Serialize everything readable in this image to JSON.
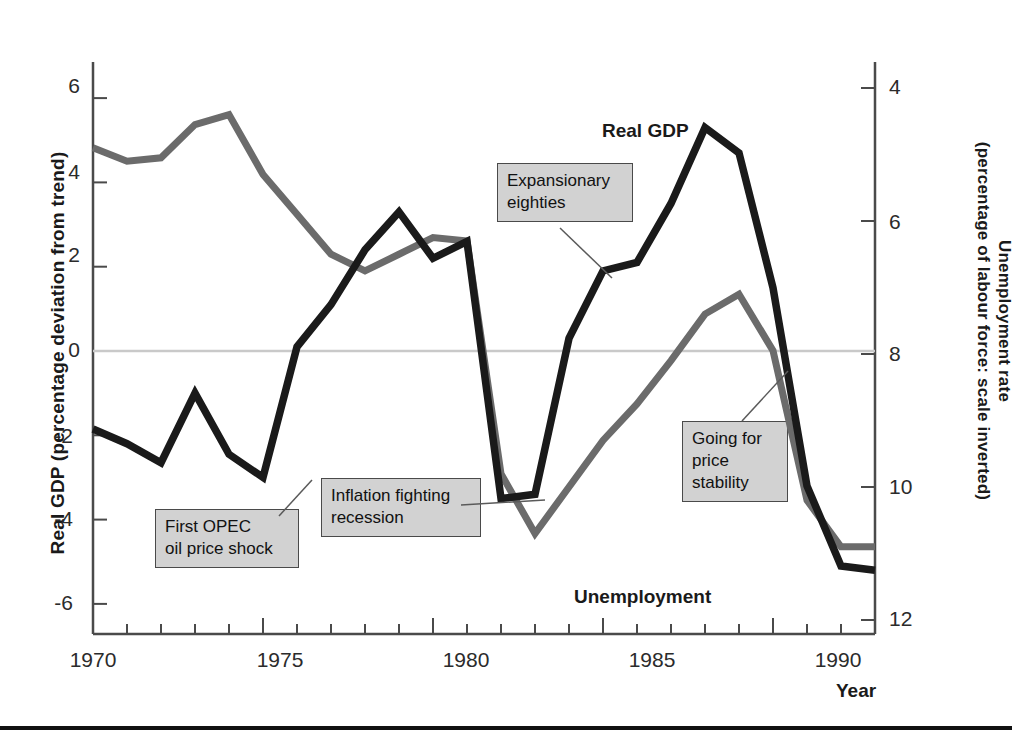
{
  "axes": {
    "left_title": "Real GDP (percentage deviation from trend)",
    "right_title": "Unemployment rate\n(percentage of labour force: scale inverted)",
    "x_title": "Year",
    "left_ticks": [
      "6",
      "4",
      "2",
      "0",
      "-2",
      "-4",
      "-6"
    ],
    "right_ticks": [
      "4",
      "6",
      "8",
      "10",
      "12"
    ],
    "x_ticks": [
      "1970",
      "1975",
      "1980",
      "1985",
      "1990"
    ]
  },
  "series_labels": {
    "gdp": "Real GDP",
    "unemployment": "Unemployment"
  },
  "annotations": [
    {
      "id": "first-opec-oil-price-shock",
      "text": "First OPEC\noil price shock"
    },
    {
      "id": "inflation-fighting-recession",
      "text": "Inflation fighting\nrecession"
    },
    {
      "id": "expansionary-eighties",
      "text": "Expansionary\neighties"
    },
    {
      "id": "going-for-price-stability",
      "text": "Going for\nprice\nstability"
    }
  ],
  "colors": {
    "gdp_line": "#1a1a1a",
    "unemployment_line": "#6b6b6b",
    "annotation_fill": "#d2d2d2",
    "annotation_border": "#4a4a4a",
    "zero_line": "#c9c9c9",
    "axis": "#4a4a4a"
  },
  "chart_data": {
    "type": "line",
    "title": "",
    "xlabel": "Year",
    "ylabel": "Real GDP (percentage deviation from trend)",
    "y2label": "Unemployment rate (percentage of labour force: scale inverted)",
    "grid": false,
    "legend": "inline-labels",
    "xlim": [
      1970,
      1993
    ],
    "ylim": [
      -6.8,
      6.6
    ],
    "y2lim": [
      3.2,
      12.6
    ],
    "y2_inverted": true,
    "x": [
      1970,
      1971,
      1972,
      1973,
      1974,
      1975,
      1976,
      1977,
      1978,
      1979,
      1980,
      1981,
      1982,
      1983,
      1984,
      1985,
      1986,
      1987,
      1988,
      1989,
      1990,
      1991,
      1992,
      1993
    ],
    "series": [
      {
        "name": "Real GDP",
        "axis": "left",
        "units": "percentage deviation from trend",
        "color": "#1a1a1a",
        "values": [
          -1.85,
          -2.2,
          -2.65,
          -1.0,
          -2.45,
          -3.0,
          0.1,
          1.1,
          2.4,
          3.3,
          2.2,
          2.6,
          -3.5,
          -3.4,
          0.3,
          1.9,
          2.1,
          3.5,
          5.3,
          4.7,
          1.5,
          -3.2,
          -5.1,
          -5.2
        ]
      },
      {
        "name": "Unemployment",
        "axis": "right",
        "units": "percentage of labour force (scale inverted)",
        "color": "#6b6b6b",
        "values": [
          4.9,
          5.1,
          5.05,
          4.55,
          4.4,
          5.3,
          5.9,
          6.5,
          6.75,
          6.5,
          6.25,
          6.3,
          9.8,
          10.7,
          10.0,
          9.3,
          8.75,
          8.1,
          7.4,
          7.1,
          7.95,
          10.2,
          10.9,
          10.9
        ]
      }
    ],
    "annotations": [
      {
        "text": "First OPEC oil price shock",
        "points_to_year": 1975,
        "series": "Real GDP"
      },
      {
        "text": "Inflation fighting recession",
        "points_to_year": 1982,
        "series": "Real GDP"
      },
      {
        "text": "Expansionary eighties",
        "points_to_year": 1985,
        "series": "Real GDP"
      },
      {
        "text": "Going for price stability",
        "points_to_year": 1989,
        "series": "Unemployment"
      }
    ]
  }
}
